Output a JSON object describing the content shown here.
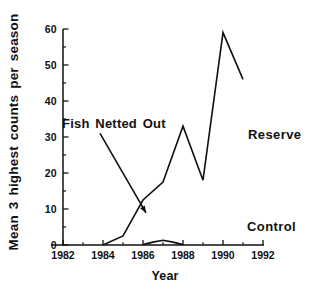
{
  "page": {
    "background": "#ffffff",
    "ink": "#111111"
  },
  "chart_data": {
    "type": "line",
    "title": "",
    "xlabel": "Year",
    "ylabel": "Mean 3 highest counts per season",
    "xlim": [
      1982,
      1992
    ],
    "ylim": [
      0,
      60
    ],
    "grid": false,
    "legend": "inline-labels",
    "x_major_ticks": [
      1982,
      1984,
      1986,
      1988,
      1990,
      1992
    ],
    "x_minor_ticks": [
      1983,
      1985,
      1987,
      1989,
      1991
    ],
    "y_major_ticks": [
      0,
      10,
      20,
      30,
      40,
      50,
      60
    ],
    "y_minor_ticks": [
      5,
      15,
      25,
      35,
      45,
      55
    ],
    "series": [
      {
        "name": "Reserve",
        "x": [
          1984,
          1985,
          1986,
          1987,
          1988,
          1989,
          1990,
          1991
        ],
        "values": [
          0,
          2.5,
          12.5,
          17.5,
          33,
          18,
          59,
          46
        ],
        "label_anchor": {
          "year": 1991.25,
          "value": 29.5
        }
      },
      {
        "name": "Control",
        "x": [
          1986,
          1986.5,
          1987,
          1987.5,
          1988
        ],
        "values": [
          0.1,
          0.8,
          1.3,
          0.8,
          0.1
        ],
        "label_anchor": {
          "year": 1991.2,
          "value": 4.0
        }
      }
    ],
    "annotation": {
      "text": "Fish Netted Out",
      "text_anchor": {
        "year": 1981.95,
        "value": 32.5
      },
      "arrow_from": {
        "year": 1983.85,
        "value": 31.0
      },
      "arrow_to": {
        "year": 1986.15,
        "value": 8.9
      }
    }
  }
}
